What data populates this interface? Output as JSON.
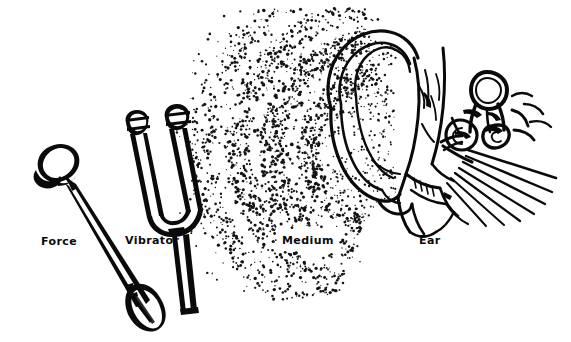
{
  "figure": {
    "background_color": "#ffffff",
    "ink_color": "#0a0a0a",
    "width": 571,
    "height": 342,
    "style": "line-art pen and ink illustration with stipple shading"
  },
  "labels": {
    "force": "Force",
    "vibrator": "Vibrator",
    "medium": "Medium",
    "ear": "Ear"
  },
  "objects": {
    "mallet": {
      "name": "Force",
      "description": "rubber-tipped reflex mallet with rounded head upper-left and tapered bulbous handle lower-right"
    },
    "tuning_fork": {
      "name": "Vibrator",
      "description": "two-tined tuning fork with weighted bulb tips, U-shaped base and straight stem"
    },
    "sound_waves": {
      "name": "Medium",
      "description": "stippled concentric arcs representing sound wave fronts travelling through air"
    },
    "ear_anatomy": {
      "name": "Ear",
      "description": "cutaway of outer ear pinna, ear canal, eardrum, ossicles, cochlea, semicircular canals and auditory nerve fibres"
    }
  }
}
